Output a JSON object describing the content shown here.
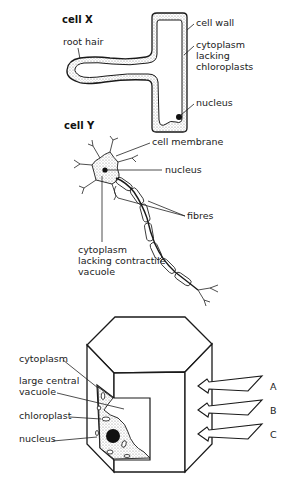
{
  "cell_x": {
    "title": "cell X",
    "labels": {
      "root_hair": "root hair",
      "cell_wall": "cell wall",
      "cytoplasm_1": "cytoplasm",
      "cytoplasm_2": "lacking",
      "cytoplasm_3": "chloroplasts",
      "nucleus": "nucleus"
    }
  },
  "cell_y": {
    "title": "cell Y",
    "labels": {
      "cell_membrane": "cell membrane",
      "nucleus": "nucleus",
      "fibres": "fibres",
      "cytoplasm_1": "cytoplasm",
      "cytoplasm_2": "lacking contractile",
      "cytoplasm_3": "vacuole"
    }
  },
  "cell_z": {
    "labels": {
      "cytoplasm": "cytoplasm",
      "vacuole_1": "large central",
      "vacuole_2": "vacuole",
      "chloroplast": "chloroplast",
      "nucleus": "nucleus"
    },
    "arrows": [
      "A",
      "B",
      "C"
    ]
  },
  "colors": {
    "line": "#1a1a1a",
    "stipple": "#c8c8c8",
    "background": "#ffffff"
  }
}
